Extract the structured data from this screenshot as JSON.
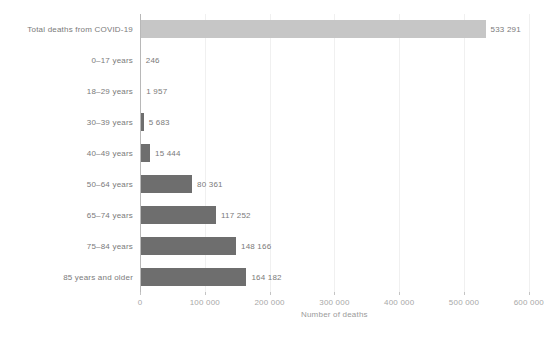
{
  "chart_data": {
    "type": "bar",
    "orientation": "horizontal",
    "title": "",
    "xlabel": "Number of deaths",
    "ylabel": "",
    "xlim": [
      0,
      600000
    ],
    "grid": true,
    "legend": "none",
    "xticks": [
      "0",
      "100 000",
      "200 000",
      "300 000",
      "400 000",
      "500 000",
      "600 000"
    ],
    "xtick_values": [
      0,
      100000,
      200000,
      300000,
      400000,
      500000,
      600000
    ],
    "categories": [
      "Total deaths from COVID-19",
      "0–17 years",
      "18–29 years",
      "30–39 years",
      "40–49 years",
      "50–64 years",
      "65–74 years",
      "75–84 years",
      "85 years and older"
    ],
    "values": [
      533291,
      246,
      1957,
      5683,
      15444,
      80361,
      117252,
      148166,
      164182
    ],
    "value_labels": [
      "533 291",
      "246",
      "1 957",
      "5 683",
      "15 444",
      "80 361",
      "117 252",
      "148 166",
      "164 182"
    ],
    "colors": {
      "total_bar": "#c6c6c6",
      "age_bar": "#6e6e6e",
      "gridline": "#f0f0f0",
      "axis": "#b8b8b8",
      "label_text": "#7a7a7a",
      "tick_text": "#a8a8a8",
      "background": "#ffffff"
    }
  }
}
